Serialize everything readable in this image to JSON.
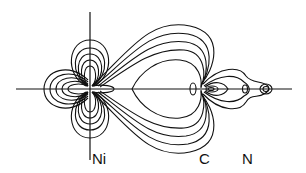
{
  "diagram": {
    "type": "electron density contour plot",
    "atoms": [
      {
        "label": "Ni",
        "x": 90
      },
      {
        "label": "C",
        "x": 203
      },
      {
        "label": "N",
        "x": 248
      }
    ],
    "line_color": "#111111",
    "background": "#ffffff"
  }
}
